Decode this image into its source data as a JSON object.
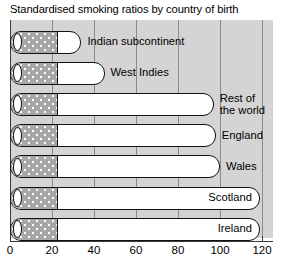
{
  "chart_data": {
    "type": "bar",
    "orientation": "horizontal",
    "title": "Standardised smoking ratios by country of birth",
    "xlabel": "",
    "ylabel": "",
    "xlim": [
      0,
      124
    ],
    "xticks": [
      0,
      20,
      40,
      60,
      80,
      100,
      120
    ],
    "xticklabels": [
      "0",
      "20",
      "40",
      "60",
      "80",
      "100",
      "120"
    ],
    "grid": "vertical",
    "legend": "none",
    "bar_style": "cigarette",
    "filter_length": 22,
    "categories": [
      "Indian subcontinent",
      "West Indies",
      "Rest of the world",
      "England",
      "Wales",
      "Scotland",
      "Ireland"
    ],
    "values": [
      34,
      45,
      97,
      98,
      100,
      119,
      119
    ]
  },
  "title": "Standardised smoking ratios by country of birth",
  "axis": {
    "ticks": [
      {
        "label": "0",
        "value": 0
      },
      {
        "label": "20",
        "value": 20
      },
      {
        "label": "40",
        "value": 40
      },
      {
        "label": "60",
        "value": 60
      },
      {
        "label": "80",
        "value": 80
      },
      {
        "label": "100",
        "value": 100
      },
      {
        "label": "120",
        "value": 120
      }
    ]
  },
  "bars": [
    {
      "label": "Indian subcontinent",
      "value": 34,
      "label_placement": "outside"
    },
    {
      "label": "West Indies",
      "value": 45,
      "label_placement": "outside"
    },
    {
      "label": "Rest of\nthe world",
      "label_line1": "Rest of",
      "label_line2": "the world",
      "value": 97,
      "label_placement": "outside"
    },
    {
      "label": "England",
      "value": 98,
      "label_placement": "outside"
    },
    {
      "label": "Wales",
      "value": 100,
      "label_placement": "outside"
    },
    {
      "label": "Scotland",
      "value": 119,
      "label_placement": "inside"
    },
    {
      "label": "Ireland",
      "value": 119,
      "label_placement": "inside"
    }
  ],
  "colors": {
    "panel_background": "#d4d4d4",
    "gridline": "#8a8a8a",
    "axis": "#3a3a3a",
    "bar_outline": "#111111",
    "bar_body": "#ffffff",
    "filter": "#a8a8a8",
    "text": "#000000",
    "figure_background": "#ffffff"
  }
}
